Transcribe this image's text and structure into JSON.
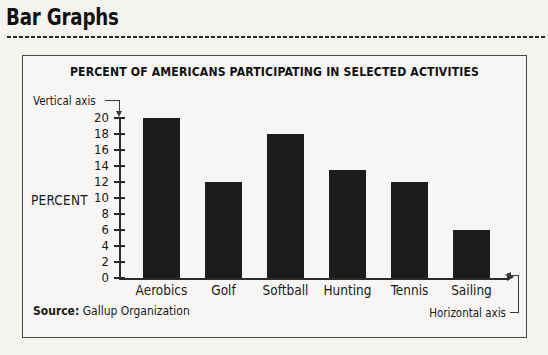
{
  "page": {
    "title": "Bar Graphs"
  },
  "figure": {
    "chart_title": "PERCENT OF AMERICANS PARTICIPATING IN SELECTED ACTIVITIES",
    "source_label": "Source:",
    "source_value": "Gallup Organization",
    "annotations": {
      "vertical_axis": "Vertical axis",
      "horizontal_axis": "Horizontal axis"
    }
  },
  "chart_data": {
    "type": "bar",
    "title": "PERCENT OF AMERICANS PARTICIPATING IN SELECTED ACTIVITIES",
    "xlabel": "",
    "ylabel": "PERCENT",
    "categories": [
      "Aerobics",
      "Golf",
      "Softball",
      "Hunting",
      "Tennis",
      "Sailing"
    ],
    "values": [
      20,
      12,
      18,
      13.5,
      12,
      6
    ],
    "ylim": [
      0,
      20
    ],
    "ytick_step": 2,
    "yticks": [
      20,
      18,
      16,
      14,
      12,
      10,
      8,
      6,
      4,
      2,
      0
    ],
    "grid": false,
    "legend": null,
    "bar_color": "#1c1c1c",
    "source": "Gallup Organization"
  },
  "colors": {
    "page_background": "#f4f3f0",
    "figure_background": "#f7f6f4",
    "ink": "#1a1a1a",
    "bar": "#1c1c1c",
    "border": "#4a4a4a"
  }
}
